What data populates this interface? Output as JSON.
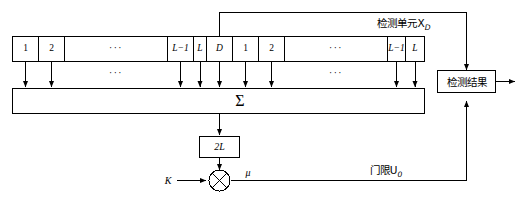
{
  "diagram": {
    "title_text": "检测单元X",
    "title_sub": "D",
    "reference_cells_left": [
      {
        "label": "1",
        "italic": false
      },
      {
        "label": "2",
        "italic": false
      },
      {
        "label": "···",
        "italic": false
      },
      {
        "label": "L−1",
        "italic": true
      },
      {
        "label": "L",
        "italic": true
      }
    ],
    "detection_cell": {
      "label": "D",
      "italic": true
    },
    "reference_cells_right": [
      {
        "label": "1",
        "italic": false
      },
      {
        "label": "2",
        "italic": false
      },
      {
        "label": "···",
        "italic": false
      },
      {
        "label": "L−1",
        "italic": true
      },
      {
        "label": "L",
        "italic": true
      }
    ],
    "summer_label": "Σ",
    "middle_ellipsis": "···",
    "divider_box_label": "2L",
    "scale_input_label": "K",
    "multiplier_glyph": "⊗",
    "threshold_output_label": "μ",
    "threshold_path_label": "门限U",
    "threshold_path_sub": "0",
    "result_box_label": "检测结果",
    "colors": {
      "line": "#000000",
      "background": "#ffffff",
      "text": "#000000"
    }
  }
}
